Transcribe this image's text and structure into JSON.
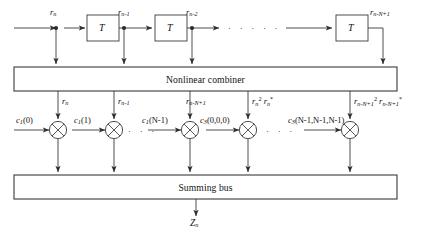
{
  "diagram": {
    "delay_line": {
      "delay_block_label": "T",
      "taps": [
        {
          "name": "tap-rn",
          "base": "r",
          "sub": "n",
          "sup": ""
        },
        {
          "name": "tap-rn-1",
          "base": "r",
          "sub": "n-1",
          "sup": ""
        },
        {
          "name": "tap-rn-2",
          "base": "r",
          "sub": "n-2",
          "sup": ""
        },
        {
          "name": "tap-rn-N+1",
          "base": "r",
          "sub": "n-N+1",
          "sup": ""
        }
      ],
      "ellipsis": "· · · · ·"
    },
    "combiner": {
      "label": "Nonlinear combiner"
    },
    "branch_inputs": [
      {
        "name": "branch-input-rn",
        "parts": [
          {
            "base": "r",
            "sub": "n",
            "sup": ""
          }
        ]
      },
      {
        "name": "branch-input-rn-1",
        "parts": [
          {
            "base": "r",
            "sub": "n-1",
            "sup": ""
          }
        ]
      },
      {
        "name": "branch-input-rn-N+1",
        "parts": [
          {
            "base": "r",
            "sub": "n-N+1",
            "sup": ""
          }
        ]
      },
      {
        "name": "branch-input-rn2-rnstar",
        "parts": [
          {
            "base": "r",
            "sub": "n",
            "sup": "2"
          },
          {
            "base": "r",
            "sub": "n",
            "sup": "*"
          }
        ]
      },
      {
        "name": "branch-input-rnN2-rnNstar",
        "parts": [
          {
            "base": "r",
            "sub": "n-N+1",
            "sup": "2"
          },
          {
            "base": "r",
            "sub": "n-N+1",
            "sup": "*"
          }
        ]
      }
    ],
    "coefficients": [
      {
        "name": "coef-c1-0",
        "base": "c",
        "sub": "1",
        "args": "(0)"
      },
      {
        "name": "coef-c1-1",
        "base": "c",
        "sub": "1",
        "args": "(1)"
      },
      {
        "name": "coef-c1-N-1",
        "base": "c",
        "sub": "1",
        "args": "(N-1)"
      },
      {
        "name": "coef-c3-000",
        "base": "c",
        "sub": "3",
        "args": "(0,0,0)"
      },
      {
        "name": "coef-c3-NNN",
        "base": "c",
        "sub": "3",
        "args": "(N-1,N-1,N-1)"
      }
    ],
    "multiplier_ellipsis": "· · ·",
    "summing_bus": {
      "label": "Summing bus"
    },
    "output": {
      "base": "Z",
      "sub": "n"
    },
    "colors": {
      "line": "#3a3a3a",
      "text": "#111111",
      "background": "#ffffff"
    }
  }
}
